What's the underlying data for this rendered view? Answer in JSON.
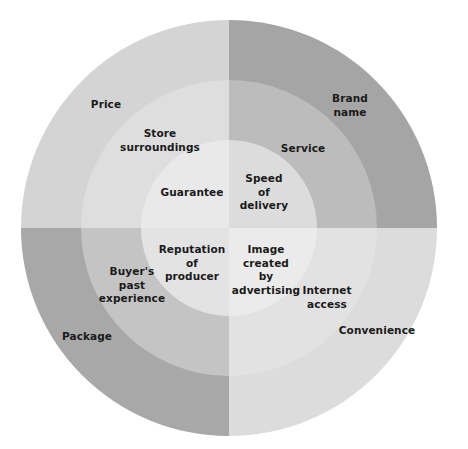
{
  "figure": {
    "type": "concentric-circle-quadrant-diagram",
    "background_color": "#ffffff",
    "label_color": "#1a1a1a",
    "center": {
      "x": 229,
      "y": 228
    },
    "radii": {
      "inner": 88,
      "middle": 148,
      "outer": 208
    }
  },
  "quadrants": [
    {
      "name": "top-left",
      "colors": {
        "inner": "#e9e9e9",
        "middle": "#dedede",
        "outer": "#d4d4d4"
      }
    },
    {
      "name": "top-right",
      "colors": {
        "inner": "#dcdcdc",
        "middle": "#bcbcbc",
        "outer": "#a5a5a5"
      }
    },
    {
      "name": "bottom-left",
      "colors": {
        "inner": "#e3e3e3",
        "middle": "#c4c4c4",
        "outer": "#a8a8a8"
      }
    },
    {
      "name": "bottom-right",
      "colors": {
        "inner": "#ebebeb",
        "middle": "#e2e2e2",
        "outer": "#dcdcdc"
      }
    }
  ],
  "labels": [
    {
      "id": "price",
      "text": "Price",
      "x": 106,
      "y": 104,
      "quadrant": "top-left",
      "ring": "outer"
    },
    {
      "id": "store-surroundings",
      "text": "Store\nsurroundings",
      "x": 160,
      "y": 140,
      "quadrant": "top-left",
      "ring": "middle"
    },
    {
      "id": "brand-name",
      "text": "Brand\nname",
      "x": 350,
      "y": 105,
      "quadrant": "top-right",
      "ring": "outer"
    },
    {
      "id": "service",
      "text": "Service",
      "x": 303,
      "y": 148,
      "quadrant": "top-right",
      "ring": "middle"
    },
    {
      "id": "guarantee",
      "text": "Guarantee",
      "x": 192,
      "y": 192,
      "quadrant": "top-left",
      "ring": "inner"
    },
    {
      "id": "speed-of-delivery",
      "text": "Speed\nof\ndelivery",
      "x": 264,
      "y": 192,
      "quadrant": "top-right",
      "ring": "inner"
    },
    {
      "id": "reputation-of-producer",
      "text": "Reputation\nof\nproducer",
      "x": 192,
      "y": 263,
      "quadrant": "bottom-left",
      "ring": "inner"
    },
    {
      "id": "image-created-by-advertising",
      "text": "Image\ncreated\nby\nadvertising",
      "x": 266,
      "y": 270,
      "quadrant": "bottom-right",
      "ring": "inner"
    },
    {
      "id": "buyers-past-experience",
      "text": "Buyer's\npast\nexperience",
      "x": 132,
      "y": 285,
      "quadrant": "bottom-left",
      "ring": "middle"
    },
    {
      "id": "internet-access",
      "text": "Internet\naccess",
      "x": 327,
      "y": 297,
      "quadrant": "bottom-right",
      "ring": "middle"
    },
    {
      "id": "package",
      "text": "Package",
      "x": 87,
      "y": 336,
      "quadrant": "bottom-left",
      "ring": "outer"
    },
    {
      "id": "convenience",
      "text": "Convenience",
      "x": 377,
      "y": 330,
      "quadrant": "bottom-right",
      "ring": "outer"
    }
  ]
}
